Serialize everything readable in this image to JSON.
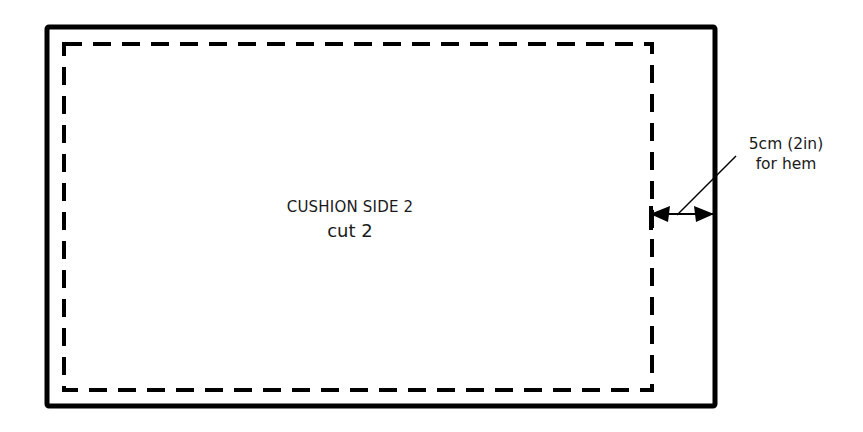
{
  "diagram": {
    "type": "sewing-pattern",
    "piece": {
      "name": "CUSHION SIDE 2",
      "instruction": "cut 2"
    },
    "outer_outline": {
      "style": "solid",
      "x": 47,
      "y": 27,
      "width": 668,
      "height": 379
    },
    "inner_stitch_line": {
      "style": "dashed",
      "x": 64,
      "y": 43,
      "width": 588,
      "height": 347
    },
    "annotation": {
      "line1": "5cm (2in)",
      "line2": "for hem",
      "dimension": "5cm (2in)",
      "arrow": {
        "from_x": 652,
        "to_x": 715,
        "y": 214
      }
    },
    "colors": {
      "line": "#000000",
      "background": "#ffffff",
      "text": "#1a1a1a"
    }
  }
}
